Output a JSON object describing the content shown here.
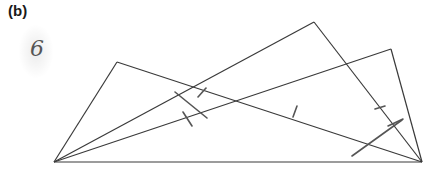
{
  "figure": {
    "label": "(b)",
    "handwritten_note": "6"
  },
  "diagram": {
    "stroke_color": "#3a3a3a",
    "tick_color": "#555555",
    "points": {
      "A": [
        54,
        162
      ],
      "B": [
        422,
        162
      ],
      "C": [
        314,
        22
      ],
      "D": [
        117,
        62
      ],
      "E": [
        391,
        49
      ]
    },
    "segments": [
      [
        "A",
        "B"
      ],
      [
        "A",
        "C"
      ],
      [
        "C",
        "B"
      ],
      [
        "A",
        "D"
      ],
      [
        "D",
        "B"
      ],
      [
        "A",
        "E"
      ],
      [
        "E",
        "B"
      ]
    ],
    "tick_marks": [
      [
        [
          175,
          92
        ],
        [
          207,
          118
        ]
      ],
      [
        [
          183,
          112
        ],
        [
          192,
          126
        ]
      ],
      [
        [
          198,
          97
        ],
        [
          206,
          88
        ]
      ],
      [
        [
          293,
          117
        ],
        [
          297,
          106
        ]
      ],
      [
        [
          375,
          109
        ],
        [
          385,
          106
        ]
      ],
      [
        [
          388,
          126
        ],
        [
          403,
          119
        ]
      ],
      [
        [
          352,
          156
        ],
        [
          402,
          120
        ]
      ]
    ]
  }
}
